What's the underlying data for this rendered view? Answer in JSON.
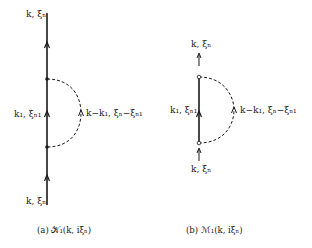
{
  "figure": {
    "panel_a": {
      "caption": "(a)  𝒦₁(k, iξₙ)",
      "labels": {
        "top": "k, ξₙ",
        "middle_left": "k₁, ξₙ₁",
        "middle_right": "k−k₁, ξₙ−ξₙ₁",
        "bottom": "k, ξₙ"
      },
      "vertex_style": "filled-dot",
      "line_style": "solid",
      "loop_style": "dashed"
    },
    "panel_b": {
      "caption": "(b)  ℳ₁(k, iξₙ)",
      "labels": {
        "top": "k, ξₙ",
        "middle_left": "k₁, ξₙ₁",
        "middle_right": "k−k₁, ξₙ−ξₙ₁",
        "bottom": "k, ξₙ"
      },
      "vertex_style": "open-circle",
      "line_style": "solid",
      "loop_style": "dashed"
    },
    "colors": {
      "ink": "#1a1a1a",
      "background": "#ffffff"
    }
  }
}
